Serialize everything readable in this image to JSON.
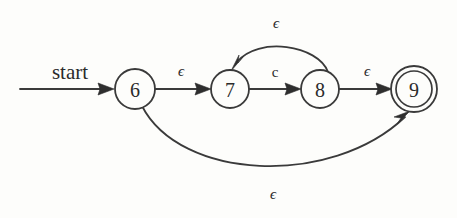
{
  "diagram": {
    "kind": "nfa-state-diagram",
    "title": "",
    "background_color": "#fdfdfb",
    "line_color": "#3a3a3a",
    "text_color": "#2b2b2b",
    "start_label": "start",
    "states": [
      {
        "id": "6",
        "label": "6",
        "cx": 135,
        "cy": 89,
        "r": 20,
        "accepting": false,
        "start": true
      },
      {
        "id": "7",
        "label": "7",
        "cx": 230,
        "cy": 89,
        "r": 19,
        "accepting": false,
        "start": false
      },
      {
        "id": "8",
        "label": "8",
        "cx": 320,
        "cy": 89,
        "r": 19,
        "accepting": false,
        "start": false
      },
      {
        "id": "9",
        "label": "9",
        "cx": 414,
        "cy": 89,
        "r": 18,
        "r_outer": 23,
        "accepting": true,
        "start": false
      }
    ],
    "transitions": [
      {
        "from": "6",
        "to": "7",
        "label": "ϵ",
        "shape": "straight",
        "label_x": 181,
        "label_y": 71
      },
      {
        "from": "7",
        "to": "8",
        "label": "c",
        "shape": "straight",
        "label_x": 275,
        "label_y": 72
      },
      {
        "from": "8",
        "to": "9",
        "label": "ϵ",
        "shape": "straight",
        "label_x": 367,
        "label_y": 71
      },
      {
        "from": "8",
        "to": "7",
        "label": "ϵ",
        "shape": "arc-above",
        "label_x": 276,
        "label_y": 23
      },
      {
        "from": "6",
        "to": "9",
        "label": "ϵ",
        "shape": "arc-below",
        "label_x": 273,
        "label_y": 194
      }
    ],
    "labels": {
      "epsilon": "ϵ",
      "symbol_c": "c"
    }
  }
}
